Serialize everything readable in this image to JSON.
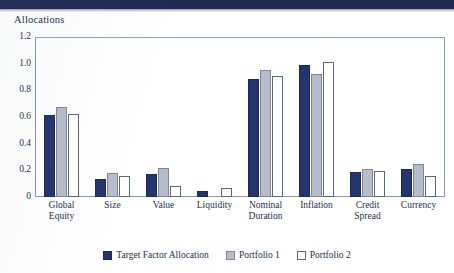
{
  "page": {
    "band_color": "#1d2a52",
    "text_color": "#23304f"
  },
  "chart_data": {
    "type": "bar",
    "title": "Allocations",
    "xlabel": "",
    "ylabel": "",
    "ylim": [
      0,
      1.2
    ],
    "ytick_labels": [
      "1.2",
      "1.0",
      "0.8",
      "0.6",
      "0.4",
      "0.2",
      "0"
    ],
    "ytick_values": [
      1.2,
      1.0,
      0.8,
      0.6,
      0.4,
      0.2,
      0
    ],
    "grid": false,
    "legend_position": "bottom-center",
    "categories": [
      "Global Equity",
      "Size",
      "Value",
      "Liquidity",
      "Nominal Duration",
      "Inflation",
      "Credit Spread",
      "Currency"
    ],
    "category_lines": [
      [
        "Global",
        "Equity"
      ],
      [
        "Size"
      ],
      [
        "Value"
      ],
      [
        "Liquidity"
      ],
      [
        "Nominal",
        "Duration"
      ],
      [
        "Inflation"
      ],
      [
        "Credit",
        "Spread"
      ],
      [
        "Currency"
      ]
    ],
    "series": [
      {
        "name": "Target Factor Allocation",
        "color": "#24356e",
        "values": [
          0.62,
          0.135,
          0.17,
          0.045,
          0.89,
          1.0,
          0.19,
          0.215
        ]
      },
      {
        "name": "Portfolio 1",
        "color": "#b6bcca",
        "values": [
          0.68,
          0.18,
          0.22,
          0.0,
          0.96,
          0.93,
          0.215,
          0.25
        ]
      },
      {
        "name": "Portfolio 2",
        "color": "#ffffff",
        "values": [
          0.625,
          0.155,
          0.08,
          0.065,
          0.91,
          1.02,
          0.195,
          0.155
        ]
      }
    ]
  }
}
